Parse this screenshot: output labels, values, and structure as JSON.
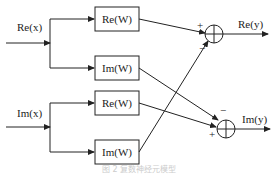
{
  "inputs": {
    "re_x": "Re(x)",
    "im_x": "Im(x)"
  },
  "blocks": [
    {
      "id": "re_w_1",
      "label": "Re(W)"
    },
    {
      "id": "im_w_1",
      "label": "Im(W)"
    },
    {
      "id": "re_w_2",
      "label": "Re(W)"
    },
    {
      "id": "im_w_2",
      "label": "Im(W)"
    }
  ],
  "outputs": {
    "re_y": "Re(y)",
    "im_y": "Im(y)"
  },
  "signs": {
    "top_plus": "+",
    "top_minus": "−",
    "bottom_minus": "−",
    "bottom_plus": "+"
  },
  "caption": "图 2 复数神经元模型"
}
